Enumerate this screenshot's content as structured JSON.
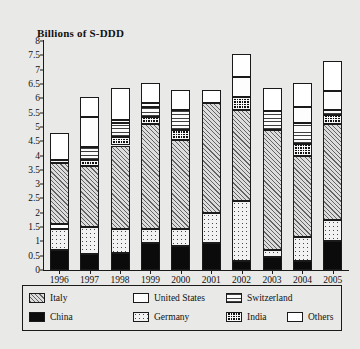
{
  "chart_data": {
    "type": "bar",
    "stacked": true,
    "title": "Billions of S-DDD",
    "xlabel": "Year",
    "ylabel": "Billions of S-DDD",
    "ylim": [
      0,
      8
    ],
    "ytick_step": 0.5,
    "grid": false,
    "legend_position": "bottom",
    "yticks": [
      "0",
      "0.5",
      "1",
      "1.5",
      "2",
      "2.5",
      "3",
      "3.5",
      "4",
      "4.5",
      "5",
      "5.5",
      "6",
      "6.5",
      "7",
      "7.5",
      "8"
    ],
    "categories": [
      "1996",
      "1997",
      "1998",
      "1999",
      "2000",
      "2001",
      "2002",
      "2003",
      "2004",
      "2005"
    ],
    "series": [
      {
        "name": "China",
        "key": "china",
        "pattern": "solid-black",
        "values": [
          0.7,
          0.55,
          0.6,
          0.95,
          0.85,
          0.95,
          0.3,
          0.45,
          0.3,
          1.0
        ]
      },
      {
        "name": "Germany",
        "key": "germany",
        "pattern": "fine-dots",
        "values": [
          0.75,
          0.95,
          0.85,
          0.5,
          0.6,
          1.05,
          2.1,
          0.25,
          0.85,
          0.75
        ]
      },
      {
        "name": "United States",
        "key": "united-states",
        "pattern": "sparse-dots",
        "values": [
          0.15,
          0.0,
          0.0,
          0.0,
          0.0,
          0.0,
          0.0,
          0.0,
          0.0,
          0.0
        ]
      },
      {
        "name": "Italy",
        "key": "italy",
        "pattern": "diagonal-hatch",
        "values": [
          2.15,
          2.15,
          2.9,
          3.65,
          3.1,
          3.85,
          3.2,
          4.2,
          2.85,
          3.35
        ]
      },
      {
        "name": "India",
        "key": "india",
        "pattern": "checkerboard",
        "values": [
          0.1,
          0.2,
          0.3,
          0.25,
          0.35,
          0.0,
          0.45,
          0.0,
          0.4,
          0.3
        ]
      },
      {
        "name": "Switzerland",
        "key": "switzerland",
        "pattern": "horizontal-lines",
        "values": [
          0.0,
          0.45,
          0.5,
          0.35,
          0.7,
          0.0,
          0.0,
          0.65,
          0.75,
          0.2
        ]
      },
      {
        "name": "United States",
        "key": "us-upper",
        "pattern": "sparse-dots",
        "values": [
          0.0,
          1.05,
          0.1,
          0.15,
          0.0,
          0.0,
          0.7,
          0.0,
          0.55,
          0.65
        ]
      },
      {
        "name": "Others",
        "key": "others",
        "pattern": "white",
        "values": [
          0.95,
          0.7,
          1.1,
          0.7,
          0.7,
          0.45,
          0.8,
          0.8,
          0.85,
          1.05
        ]
      }
    ],
    "totals": [
      4.8,
      6.05,
      6.35,
      6.55,
      6.3,
      6.3,
      7.55,
      6.35,
      6.55,
      7.3
    ]
  },
  "legend": {
    "entries": [
      {
        "label": "Italy",
        "swatch": "diagonal-hatch"
      },
      {
        "label": "United States",
        "swatch": "sparse-dots"
      },
      {
        "label": "Switzerland",
        "swatch": "horizontal-lines"
      },
      {
        "label": "China",
        "swatch": "solid-black"
      },
      {
        "label": "Germany",
        "swatch": "fine-dots"
      },
      {
        "label": "India",
        "swatch": "checkerboard"
      },
      {
        "label": "Others",
        "swatch": "white"
      }
    ]
  },
  "colors": {
    "axis": "#1a1a1a",
    "background": "#e9e9e7",
    "bar_outline": "#1a1a1a"
  }
}
